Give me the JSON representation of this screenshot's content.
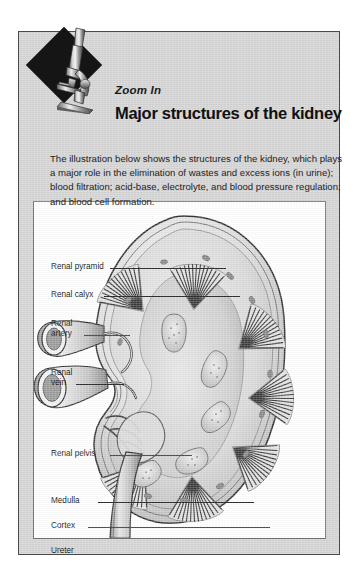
{
  "header": {
    "eyebrow": "Zoom In",
    "title": "Major structures of the kidney",
    "icon": "microscope-icon"
  },
  "intro": {
    "text": "The illustration below shows the structures of the kidney, which plays a major role in the elimination of wastes and excess ions (in urine); blood filtration; acid-base, electrolyte, and blood pressure regulation; and blood cell formation."
  },
  "figure": {
    "labels": [
      {
        "text": "Renal pyramid",
        "line": 1
      },
      {
        "text": "Renal calyx",
        "line": 1
      },
      {
        "text": "Renal",
        "line": 1
      },
      {
        "text": "artery",
        "line": 2
      },
      {
        "text": "Renal",
        "line": 1
      },
      {
        "text": "vein",
        "line": 2
      },
      {
        "text": "Renal pelvis",
        "line": 1
      },
      {
        "text": "Medulla",
        "line": 1
      },
      {
        "text": "Cortex",
        "line": 1
      },
      {
        "text": "Ureter",
        "line": 1
      }
    ]
  },
  "colors": {
    "panel_background": "#d4d4d4",
    "panel_border": "#4a4a4a",
    "figure_background": "#ffffff",
    "figure_border": "#6d6d6d",
    "text": "#111111",
    "badge_diamond": "#151515",
    "leader_line": "#2b2b2b"
  }
}
